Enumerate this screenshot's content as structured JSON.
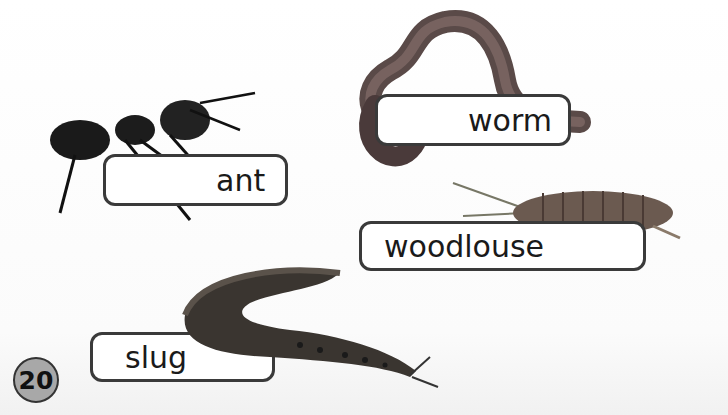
{
  "page_number": "20",
  "labels": {
    "ant": "ant",
    "worm": "worm",
    "woodlouse": "woodlouse",
    "slug": "slug"
  },
  "colors": {
    "label_border": "#3a3a3a",
    "page_badge": "#a8a8a8"
  }
}
